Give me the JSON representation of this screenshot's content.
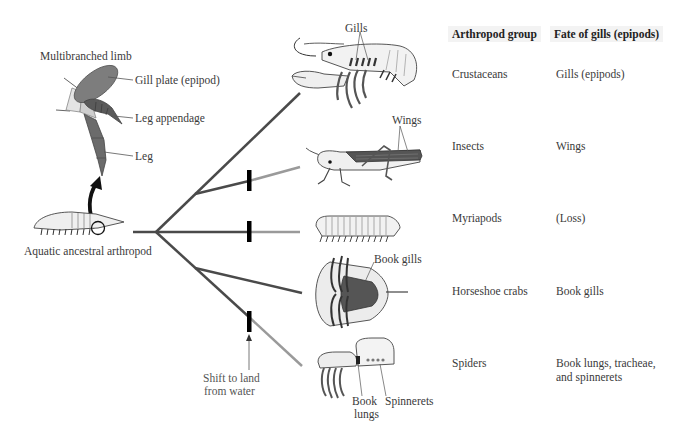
{
  "limb": {
    "title": "Multibranched limb",
    "gill_plate": "Gill plate (epipod)",
    "leg_appendage": "Leg appendage",
    "leg": "Leg"
  },
  "ancestor": {
    "label": "Aquatic ancestral arthropod"
  },
  "annotations": {
    "gills": "Gills",
    "wings": "Wings",
    "book_gills": "Book gills",
    "book_lungs_line1": "Book",
    "book_lungs_line2": "lungs",
    "spinnerets": "Spinnerets",
    "shift_line1": "Shift to land",
    "shift_line2": "from water"
  },
  "table": {
    "headers": {
      "group": "Arthropod group",
      "fate": "Fate of gills (epipods)"
    },
    "rows": [
      {
        "group": "Crustaceans",
        "fate_line1": "Gills (epipods)",
        "fate_line2": ""
      },
      {
        "group": "Insects",
        "fate_line1": "Wings",
        "fate_line2": ""
      },
      {
        "group": "Myriapods",
        "fate_line1": "(Loss)",
        "fate_line2": ""
      },
      {
        "group": "Horseshoe crabs",
        "fate_line1": "Book gills",
        "fate_line2": ""
      },
      {
        "group": "Spiders",
        "fate_line1": "Book lungs, tracheae,",
        "fate_line2": "and spinnerets"
      }
    ]
  },
  "colors": {
    "aquatic_branch": "#4a4a4a",
    "terrestrial_branch": "#8f8f8f",
    "land_marker": "#000000",
    "gill_plate": "#7d7d7d",
    "leg_dark": "#555555",
    "header_bg": "#f3f3f3"
  }
}
